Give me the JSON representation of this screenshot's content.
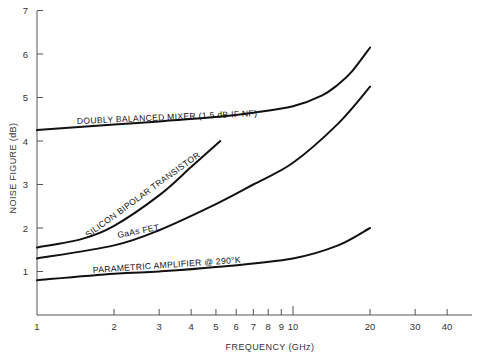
{
  "chart_data": {
    "type": "line",
    "title": "",
    "xlabel": "FREQUENCY (GHz)",
    "ylabel": "NOISE FIGURE (dB)",
    "xscale": "log",
    "xlim": [
      1,
      48
    ],
    "ylim": [
      0,
      7
    ],
    "grid": false,
    "x_ticks": [
      1,
      2,
      3,
      4,
      5,
      6,
      7,
      8,
      9,
      10,
      20,
      30,
      40
    ],
    "y_ticks": [
      1,
      2,
      3,
      4,
      5,
      6,
      7
    ],
    "series": [
      {
        "name": "DOUBLY BALANCED MIXER (1.5 dB IF NF)",
        "x": [
          1,
          2,
          3,
          5,
          7,
          10,
          13,
          15,
          17,
          20
        ],
        "y": [
          4.25,
          4.38,
          4.45,
          4.55,
          4.65,
          4.8,
          5.05,
          5.3,
          5.6,
          6.15
        ]
      },
      {
        "name": "SILICON BIPOLAR TRANSISTOR",
        "x": [
          1,
          1.5,
          2,
          3,
          4,
          5.2
        ],
        "y": [
          1.55,
          1.75,
          2.05,
          2.75,
          3.4,
          4.0
        ]
      },
      {
        "name": "GaAs FET",
        "x": [
          1,
          2,
          3,
          5,
          7,
          10,
          15,
          20
        ],
        "y": [
          1.3,
          1.6,
          1.95,
          2.55,
          3.0,
          3.5,
          4.4,
          5.25
        ]
      },
      {
        "name": "PARAMETRIC AMPLIFIER @ 290°K",
        "x": [
          1,
          2,
          3,
          5,
          10,
          15,
          20
        ],
        "y": [
          0.8,
          0.95,
          1.0,
          1.1,
          1.3,
          1.6,
          2.0
        ]
      }
    ],
    "annotations": [
      "DOUBLY BALANCED MIXER (1.5 dB IF NF)",
      "SILICON BIPOLAR TRANSISTOR",
      "GaAs FET",
      "PARAMETRIC AMPLIFIER @ 290°K"
    ]
  },
  "labels": {
    "xlabel": "FREQUENCY (GHz)",
    "ylabel": "NOISE FIGURE (dB)",
    "mixer": "DOUBLY BALANCED MIXER (1.5 dB IF NF)",
    "silicon": "SILICON BIPOLAR TRANSISTOR",
    "gaas": "GaAs FET",
    "param": "PARAMETRIC AMPLIFIER @ 290°K"
  }
}
